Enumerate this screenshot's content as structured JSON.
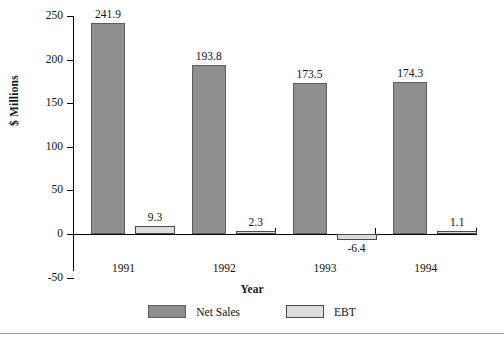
{
  "chart_data": {
    "type": "bar",
    "title": "",
    "xlabel": "Year",
    "ylabel": "$ Millions",
    "categories": [
      "1991",
      "1992",
      "1993",
      "1994"
    ],
    "ylim": [
      -50,
      250
    ],
    "yticks": [
      -50,
      0,
      50,
      100,
      150,
      200,
      250
    ],
    "ytick_labels": [
      "-50",
      "0",
      "50",
      "100",
      "150",
      "200",
      "250"
    ],
    "grid": false,
    "legend_position": "bottom",
    "series": [
      {
        "name": "Net Sales",
        "color": "#8f8f8f",
        "values": [
          241.9,
          193.8,
          173.5,
          174.3
        ],
        "labels": [
          "241.9",
          "193.8",
          "173.5",
          "174.3"
        ]
      },
      {
        "name": "EBT",
        "color": "#dcdcdc",
        "values": [
          9.3,
          2.3,
          -6.4,
          1.1
        ],
        "labels": [
          "9.3",
          "2.3",
          "-6.4",
          "1.1"
        ]
      }
    ]
  },
  "axes": {
    "y_title": "$ Millions",
    "x_title": "Year"
  },
  "legend": {
    "items": [
      {
        "label": "Net Sales",
        "swatch": "netsales-swatch"
      },
      {
        "label": "EBT",
        "swatch": "ebt-swatch"
      }
    ]
  }
}
